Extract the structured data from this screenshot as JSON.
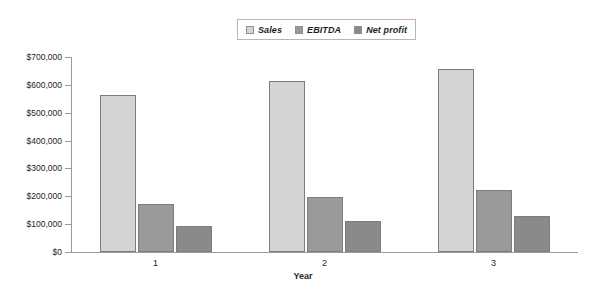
{
  "chart_data": {
    "type": "bar",
    "title": "",
    "subtitle": "",
    "xlabel": "Year",
    "ylabel": "",
    "categories": [
      "1",
      "2",
      "3"
    ],
    "series": [
      {
        "name": "Sales",
        "values": [
          565000,
          613000,
          658000
        ],
        "color": "#d4d4d4"
      },
      {
        "name": "EBITDA",
        "values": [
          172000,
          198000,
          222000
        ],
        "color": "#9a9a9a"
      },
      {
        "name": "Net profit",
        "values": [
          93000,
          113000,
          130000
        ],
        "color": "#8a8a8a"
      }
    ],
    "ylim": [
      0,
      700000
    ],
    "ytick_step": 100000,
    "ytick_labels": [
      "$0",
      "$100,000",
      "$200,000",
      "$300,000",
      "$400,000",
      "$500,000",
      "$600,000",
      "$700,000"
    ],
    "ytick_values": [
      0,
      100000,
      200000,
      300000,
      400000,
      500000,
      600000,
      700000
    ],
    "grid": false,
    "legend_position": "top-center",
    "bar_border_color": "#7d7d7d",
    "axis_color": "#9b9b9b"
  },
  "legend": {
    "entries": [
      {
        "label": "Sales"
      },
      {
        "label": "EBITDA"
      },
      {
        "label": "Net profit"
      }
    ]
  },
  "axes": {
    "x_title": "Year"
  }
}
